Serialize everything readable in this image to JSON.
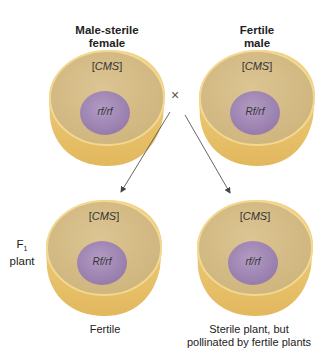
{
  "header_cropped_text": "",
  "parents": {
    "female": {
      "title_line1": "Male-sterile",
      "title_line2": "female",
      "cytoplasm": "CMS",
      "genotype": "rf/rf"
    },
    "male": {
      "title_line1": "Fertile",
      "title_line2": "male",
      "cytoplasm": "CMS",
      "genotype": "Rf/rf"
    }
  },
  "cross_symbol": "×",
  "generation_label": {
    "line1": "F",
    "subscript": "1",
    "line2": "plant"
  },
  "offspring": [
    {
      "cytoplasm": "CMS",
      "genotype": "Rf/rf",
      "caption_line1": "Fertile",
      "caption_line2": ""
    },
    {
      "cytoplasm": "CMS",
      "genotype": "rf/rf",
      "caption_line1": "Sterile plant, but",
      "caption_line2": "pollinated by fertile plants"
    }
  ],
  "colors": {
    "cell_rim": "#e9c77a",
    "cell_inner": "#d7bf88",
    "cell_edge": "#f3d68f",
    "nucleus": "#a58ab6",
    "nucleus_edge": "#8e72a3",
    "arrow": "#555555"
  }
}
